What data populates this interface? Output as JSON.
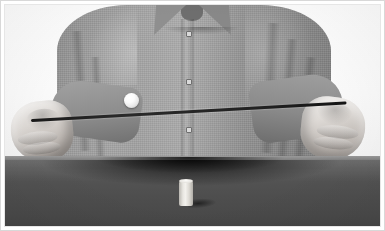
{
  "image": {
    "kind": "photograph",
    "color_mode": "grayscale",
    "title": "Person balancing a ball on a rod above a table",
    "description": "Black-and-white photograph of a seated person wearing a collared button-up shirt, holding a long thin rod horizontally with both hands. A small light-colored ball rests on the rod near the left side. A small light cylinder stands upright on the dark tabletop in the foreground."
  },
  "frame": {
    "border_color": "#d8d8d8",
    "inner_border_color": "#e6e6e6",
    "matte_color": "#ffffff"
  },
  "scene": {
    "background": {
      "name": "wall",
      "color": "#fbfbfb",
      "description": "plain bright white studio backdrop"
    },
    "table": {
      "name": "tabletop",
      "surface_color": "#525252",
      "edge_color": "#8a8a8a",
      "edge_y": 156,
      "description": "dark matte tabletop filling the lower third of the frame, with a lighter lit front edge"
    },
    "subject": {
      "name": "person-torso",
      "garment": "long-sleeve collared button shirt",
      "garment_color": "#999999",
      "button_count": 3,
      "description": "torso from shoulders to waist, arms extended forward and down to grip the rod"
    }
  },
  "objects": [
    {
      "name": "rod",
      "label": "thin dark rod",
      "color": "#1f1f1f",
      "orientation": "near-horizontal, tilted slightly up toward the right",
      "length_px": 316,
      "thickness_px": 3,
      "left_end": {
        "x": 26,
        "y": 119
      },
      "right_end": {
        "x": 342,
        "y": 101
      }
    },
    {
      "name": "ball",
      "label": "small white ball",
      "color": "#f5f5f5",
      "diameter_px": 15,
      "center": {
        "x": 126,
        "y": 100
      },
      "resting_on": "rod"
    },
    {
      "name": "cylinder",
      "label": "small light cylinder",
      "color": "#eeebe6",
      "width_px": 14,
      "height_px": 27,
      "position": {
        "x": 174,
        "y": 174
      },
      "resting_on": "tabletop",
      "shadow_direction": "right"
    },
    {
      "name": "left-hand",
      "label": "left hand gripping rod",
      "skin_tone": "#ded9d4",
      "position": {
        "x": 6,
        "y": 96
      }
    },
    {
      "name": "right-hand",
      "label": "right hand gripping rod",
      "skin_tone": "#ded9d4",
      "position": {
        "x": 296,
        "y": 92
      }
    }
  ],
  "palette": {
    "white": "#ffffff",
    "backdrop": "#fbfbfb",
    "shirt_light": "#a6a6a6",
    "shirt_mid": "#939393",
    "shirt_dark": "#7e7e7e",
    "skin": "#ded9d4",
    "table": "#525252",
    "rod": "#1f1f1f",
    "cuff": "#2e2e2e"
  }
}
